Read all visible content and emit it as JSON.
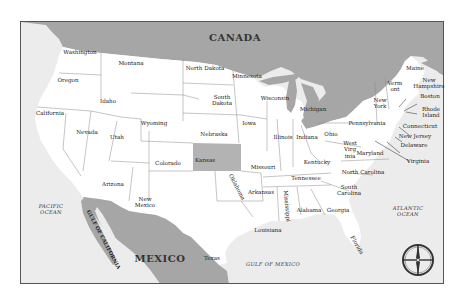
{
  "map": {
    "title": "United States Map",
    "colors": {
      "land_us": "#ffffff",
      "foreign_land": "#a6a6a6",
      "water": "#ececec",
      "highlight_state": "#b3b3b3",
      "border": "#8a8a8a",
      "frame": "#555555"
    },
    "countries": {
      "canada": "CANADA",
      "mexico": "MEXICO"
    },
    "water_bodies": {
      "pacific": "PACIFIC OCEAN",
      "pacific_line1": "PACIFIC",
      "pacific_line2": "OCEAN",
      "atlantic_line1": "ATLANTIC",
      "atlantic_line2": "OCEAN",
      "gulf_mexico": "GULF OF MEXICO",
      "gulf_california": "GULF OF CALIFORNIA"
    },
    "highlighted_state": "Kansas",
    "states": {
      "washington": "Washington",
      "oregon": "Oregon",
      "california": "California",
      "idaho": "Idaho",
      "nevada": "Nevada",
      "montana": "Montana",
      "wyoming": "Wyoming",
      "utah": "Utah",
      "arizona": "Arizona",
      "colorado": "Colorado",
      "new_mexico_1": "New",
      "new_mexico_2": "Mexico",
      "north_dakota": "North Dakota",
      "south_dakota_1": "South",
      "south_dakota_2": "Dakota",
      "nebraska": "Nebraska",
      "kansas": "Kansas",
      "oklahoma": "Oklahoma",
      "texas": "Texas",
      "minnesota": "Minnesota",
      "iowa": "Iowa",
      "missouri": "Missouri",
      "arkansas": "Arkansas",
      "louisiana": "Louisiana",
      "wisconsin": "Wisconsin",
      "illinois": "Illinois",
      "michigan": "Michigan",
      "indiana": "Indiana",
      "ohio": "Ohio",
      "kentucky": "Kentucky",
      "tennessee": "Tennessee",
      "mississippi": "Mississippi",
      "alabama": "Alabama",
      "georgia": "Georgia",
      "florida": "Florida",
      "south_carolina_1": "South",
      "south_carolina_2": "Carolina",
      "north_carolina": "North Carolina",
      "virginia": "Virginia",
      "west_virginia_1": "West",
      "west_virginia_2": "Virg",
      "west_virginia_3": "inia",
      "maryland": "Maryland",
      "delaware": "Delaware",
      "new_jersey": "New Jersey",
      "pennsylvania": "Pennsylvania",
      "new_york_1": "New",
      "new_york_2": "York",
      "connecticut": "Connecticut",
      "rhode_island_1": "Rhode",
      "rhode_island_2": "Island",
      "boston": "Boston",
      "vermont_1": "Verm",
      "vermont_2": "ont",
      "new_hampshire_1": "New",
      "new_hampshire_2": "Hampshire",
      "maine": "Maine"
    },
    "compass": "compass-rose"
  }
}
